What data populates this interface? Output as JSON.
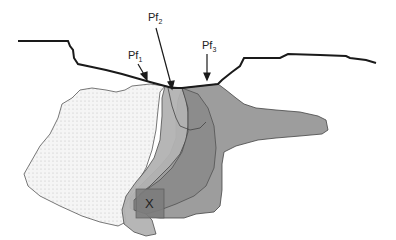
{
  "figure": {
    "labels": {
      "pf1": {
        "main": "Pf",
        "sub": "1"
      },
      "pf2": {
        "main": "Pf",
        "sub": "2"
      },
      "pf3": {
        "main": "Pf",
        "sub": "3"
      },
      "marker": "X"
    },
    "colors": {
      "surface_line": "#1a1a1a",
      "region_pf1_fill": "#f4f4f4",
      "region_pf1_dots": "#b5b5b5",
      "region_pf2_fill": "#b4b4b4",
      "region_pf3_fill": "#9d9d9d",
      "region_overlap_fill": "#888888",
      "outline": "#3a3a3a"
    }
  }
}
